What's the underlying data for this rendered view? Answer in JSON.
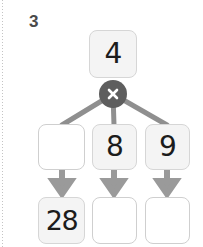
{
  "worksheet": {
    "question_number": "3",
    "operator": {
      "symbol": "×",
      "icon": "multiply-icon",
      "color": "#5e5e5e"
    },
    "top_box": {
      "value": "4",
      "state": "filled"
    },
    "middle_row": [
      {
        "value": "",
        "state": "empty"
      },
      {
        "value": "8",
        "state": "filled"
      },
      {
        "value": "9",
        "state": "filled"
      }
    ],
    "bottom_row": [
      {
        "value": "28",
        "state": "filled"
      },
      {
        "value": "",
        "state": "empty"
      },
      {
        "value": "",
        "state": "empty"
      }
    ],
    "arrows": {
      "icon": "arrow-down-icon",
      "count": 3,
      "color": "#9a9a9a"
    },
    "connectors": {
      "color": "#8f8f8f",
      "count": 3
    },
    "colors": {
      "box_fill": "#f4f4f4",
      "box_empty_fill": "#ffffff",
      "box_border": "#d2d2d2",
      "text": "#1c1c1c",
      "number_label": "#4a4a4a"
    }
  }
}
